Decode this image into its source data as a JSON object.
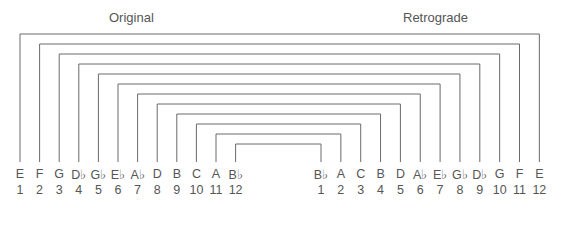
{
  "titles": {
    "left": "Original",
    "right": "Retrograde"
  },
  "original": {
    "notes": [
      "E",
      "F",
      "G",
      "D♭",
      "G♭",
      "E♭",
      "A♭",
      "D",
      "B",
      "C",
      "A",
      "B♭"
    ],
    "numbers": [
      "1",
      "2",
      "3",
      "4",
      "5",
      "6",
      "7",
      "8",
      "9",
      "10",
      "11",
      "12"
    ]
  },
  "retrograde": {
    "notes": [
      "B♭",
      "A",
      "C",
      "B",
      "D",
      "A♭",
      "E♭",
      "G♭",
      "D♭",
      "G",
      "F",
      "E"
    ],
    "numbers": [
      "1",
      "2",
      "3",
      "4",
      "5",
      "6",
      "7",
      "8",
      "9",
      "10",
      "11",
      "12"
    ]
  },
  "colors": {
    "line": "#6a6a6a",
    "text": "#555555"
  }
}
